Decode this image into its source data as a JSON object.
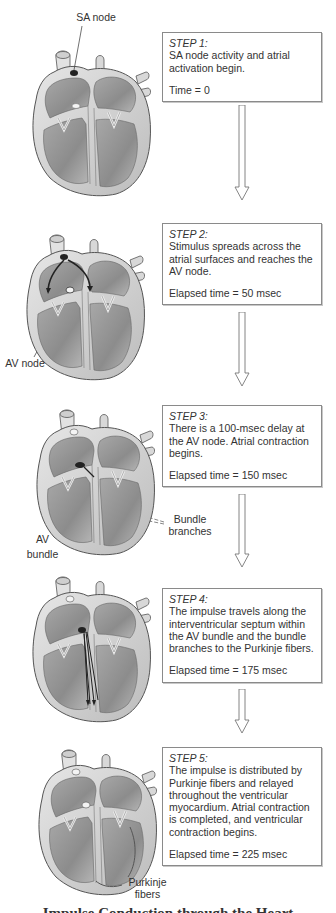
{
  "steps": [
    {
      "title": "STEP 1:",
      "description": "SA node activity and atrial activation begin.",
      "time": "Time = 0"
    },
    {
      "title": "STEP 2:",
      "description": "Stimulus spreads across the atrial surfaces and reaches the AV node.",
      "time": "Elapsed time = 50 msec"
    },
    {
      "title": "STEP 3:",
      "description": "There is a 100-msec delay at the AV node. Atrial contraction begins.",
      "time": "Elapsed time = 150 msec"
    },
    {
      "title": "STEP 4:",
      "description": "The impulse travels along the interventricular septum within the AV bundle and the bundle branches to the Purkinje fibers.",
      "time": "Elapsed time = 175 msec"
    },
    {
      "title": "STEP 5:",
      "description": "The impulse is distributed by Purkinje fibers and relayed throughout the ventricular myocardium. Atrial contraction is completed, and ventricular contraction begins.",
      "time": "Elapsed time = 225 msec"
    }
  ],
  "labels": {
    "sa_node": "SA node",
    "av_node": "AV node",
    "av_bundle_line1": "AV",
    "av_bundle_line2": "bundle",
    "bundle_branches_line1": "Bundle",
    "bundle_branches_line2": "branches",
    "purkinje_line1": "Purkinje",
    "purkinje_line2": "fibers"
  },
  "caption": "Impulse Conduction through the Heart",
  "colors": {
    "outline": "#555555",
    "chamber": "#8f8f8f",
    "wall": "#d6d6d6",
    "box_border": "#8a8a8a"
  }
}
